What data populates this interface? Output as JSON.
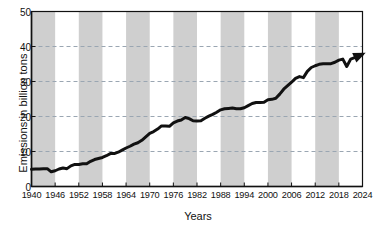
{
  "chart_data": {
    "type": "line",
    "title": "",
    "xlabel": "Years",
    "ylabel": "Emissions in billion tons",
    "xlim": [
      1940,
      2024
    ],
    "ylim": [
      0,
      50
    ],
    "grid": "horizontal dashed at 10, 20, 30, 40",
    "legend": "none",
    "annotations": [
      "arrowhead at end of line (2024)"
    ],
    "band_shading": "alternating gray vertical bands every 6 years starting 1940",
    "xticks": [
      "1940",
      "1946",
      "1952",
      "1958",
      "1964",
      "1970",
      "1976",
      "1982",
      "1988",
      "1994",
      "2000",
      "2006",
      "2012",
      "2018",
      "2024"
    ],
    "yticks": [
      "0",
      "10",
      "20",
      "30",
      "40",
      "50"
    ],
    "x": [
      1940,
      1941,
      1942,
      1943,
      1944,
      1945,
      1946,
      1947,
      1948,
      1949,
      1950,
      1951,
      1952,
      1953,
      1954,
      1955,
      1956,
      1957,
      1958,
      1959,
      1960,
      1961,
      1962,
      1963,
      1964,
      1965,
      1966,
      1967,
      1968,
      1969,
      1970,
      1971,
      1972,
      1973,
      1974,
      1975,
      1976,
      1977,
      1978,
      1979,
      1980,
      1981,
      1982,
      1983,
      1984,
      1985,
      1986,
      1987,
      1988,
      1989,
      1990,
      1991,
      1992,
      1993,
      1994,
      1995,
      1996,
      1997,
      1998,
      1999,
      2000,
      2001,
      2002,
      2003,
      2004,
      2005,
      2006,
      2007,
      2008,
      2009,
      2010,
      2011,
      2012,
      2013,
      2014,
      2015,
      2016,
      2017,
      2018,
      2019,
      2020,
      2021,
      2022,
      2023,
      2024
    ],
    "values": [
      4.9,
      5.0,
      5.0,
      5.1,
      5.1,
      4.2,
      4.5,
      5.0,
      5.3,
      5.1,
      5.9,
      6.3,
      6.3,
      6.5,
      6.5,
      7.2,
      7.7,
      8.0,
      8.3,
      8.8,
      9.4,
      9.4,
      9.8,
      10.4,
      11.0,
      11.5,
      12.1,
      12.5,
      13.2,
      14.2,
      15.2,
      15.7,
      16.4,
      17.3,
      17.3,
      17.2,
      18.2,
      18.7,
      19.0,
      19.7,
      19.4,
      18.8,
      18.7,
      18.8,
      19.5,
      20.1,
      20.6,
      21.2,
      21.9,
      22.2,
      22.3,
      22.4,
      22.2,
      22.2,
      22.5,
      23.1,
      23.7,
      24.0,
      24.0,
      24.1,
      24.8,
      24.9,
      25.2,
      26.4,
      27.8,
      28.8,
      29.8,
      30.9,
      31.4,
      31.1,
      32.9,
      34.0,
      34.5,
      34.9,
      35.1,
      35.1,
      35.1,
      35.5,
      36.1,
      36.4,
      34.3,
      36.4,
      36.8,
      37.4,
      37.8
    ],
    "line_color": "#111111",
    "band_color": "#cfcfcf",
    "grid_color": "#9aa6b2",
    "axis_color": "#111111",
    "bg_color": "#ffffff"
  },
  "axes": {
    "y_title": "Emissions in billion tons",
    "x_title": "Years"
  }
}
